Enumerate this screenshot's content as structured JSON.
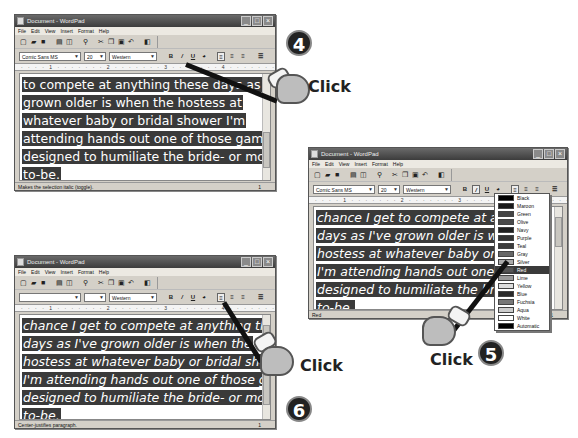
{
  "app": {
    "title": "Document - WordPad",
    "menu": [
      "File",
      "Edit",
      "View",
      "Insert",
      "Format",
      "Help"
    ],
    "toolbar_icons": [
      "new",
      "open",
      "save",
      "print",
      "print-preview",
      "find",
      "cut",
      "copy",
      "paste",
      "undo",
      "date-time"
    ],
    "format_buttons": [
      "B",
      "I",
      "U",
      "color",
      "align-left",
      "align-center",
      "align-right",
      "bullets"
    ],
    "ruler_text": "· · · · 1 · · · · · · · 2 · · · · · · · 3 · · · · · · · 4 · · · · · · · 5 · · ·"
  },
  "steps": [
    {
      "number": "4",
      "click_label": "Click",
      "font_name": "Comic Sans MS",
      "font_size": "20",
      "script": "Western",
      "status": "Makes the selection italic (toggle).",
      "status_right": "1",
      "lines": [
        "to compete at anything these days as I've",
        "grown older is when the hostess at",
        "whatever baby or bridal shower I'm",
        "attending hands out one of those games",
        "designed to humiliate the bride- or mother-",
        "to-be."
      ]
    },
    {
      "number": "5",
      "click_label": "Click",
      "font_name": "Comic Sans MS",
      "font_size": "20",
      "script": "Western",
      "status": "Red",
      "status_right": "1",
      "lines": [
        "chance I get to compete at anyt",
        "days as I've grown older is when",
        "hostess at whatever baby or bri",
        "I'm attending hands out one of",
        "designed to humiliate the bride-",
        "to-be."
      ],
      "color_menu": [
        {
          "name": "Black",
          "hex": "#000000"
        },
        {
          "name": "Maroon",
          "hex": "#800000"
        },
        {
          "name": "Green",
          "hex": "#008000"
        },
        {
          "name": "Olive",
          "hex": "#808000"
        },
        {
          "name": "Navy",
          "hex": "#000080"
        },
        {
          "name": "Purple",
          "hex": "#800080"
        },
        {
          "name": "Teal",
          "hex": "#008080"
        },
        {
          "name": "Gray",
          "hex": "#808080"
        },
        {
          "name": "Silver",
          "hex": "#c0c0c0"
        },
        {
          "name": "Red",
          "hex": "#ff0000",
          "selected": true
        },
        {
          "name": "Lime",
          "hex": "#00ff00"
        },
        {
          "name": "Yellow",
          "hex": "#ffff00"
        },
        {
          "name": "Blue",
          "hex": "#0000ff"
        },
        {
          "name": "Fuchsia",
          "hex": "#ff00ff"
        },
        {
          "name": "Aqua",
          "hex": "#00ffff"
        },
        {
          "name": "White",
          "hex": "#ffffff"
        },
        {
          "name": "Automatic",
          "hex": "#000000"
        }
      ]
    },
    {
      "number": "6",
      "click_label": "Click",
      "font_name": "",
      "font_size": "",
      "script": "Western",
      "status": "Center-justifies paragraph.",
      "status_right": "1",
      "lines": [
        "chance I get to compete at anything these",
        "days as I've grown older is when the",
        "hostess at whatever baby or bridal shower",
        "I'm attending hands out one of those games",
        "designed to humiliate the bride- or mother-",
        "to-be."
      ]
    }
  ]
}
